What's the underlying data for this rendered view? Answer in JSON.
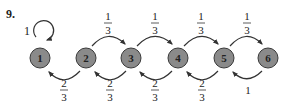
{
  "problem_number": "9.",
  "colors": {
    "node_fill": "#8a8a8a",
    "node_stroke": "#3a3a3a",
    "edge": "#333333",
    "text": "#222222"
  },
  "nodes": [
    {
      "id": "1",
      "label": "1",
      "cx": 40,
      "cy": 58
    },
    {
      "id": "2",
      "label": "2",
      "cx": 86,
      "cy": 58
    },
    {
      "id": "3",
      "label": "3",
      "cx": 131,
      "cy": 58
    },
    {
      "id": "4",
      "label": "4",
      "cx": 178,
      "cy": 58
    },
    {
      "id": "5",
      "label": "5",
      "cx": 224,
      "cy": 58
    },
    {
      "id": "6",
      "label": "6",
      "cx": 268,
      "cy": 58
    }
  ],
  "edges": {
    "self_loop": {
      "from": "1",
      "to": "1",
      "label": "1"
    },
    "forward": [
      {
        "from": "2",
        "to": "3",
        "num": "1",
        "den": "3"
      },
      {
        "from": "3",
        "to": "4",
        "num": "1",
        "den": "3"
      },
      {
        "from": "4",
        "to": "5",
        "num": "1",
        "den": "3"
      },
      {
        "from": "5",
        "to": "6",
        "num": "1",
        "den": "3"
      }
    ],
    "backward": [
      {
        "from": "2",
        "to": "1",
        "num": "2",
        "den": "3"
      },
      {
        "from": "3",
        "to": "2",
        "num": "2",
        "den": "3"
      },
      {
        "from": "4",
        "to": "3",
        "num": "2",
        "den": "3"
      },
      {
        "from": "5",
        "to": "4",
        "num": "2",
        "den": "3"
      },
      {
        "from": "6",
        "to": "5",
        "label": "1"
      }
    ]
  }
}
